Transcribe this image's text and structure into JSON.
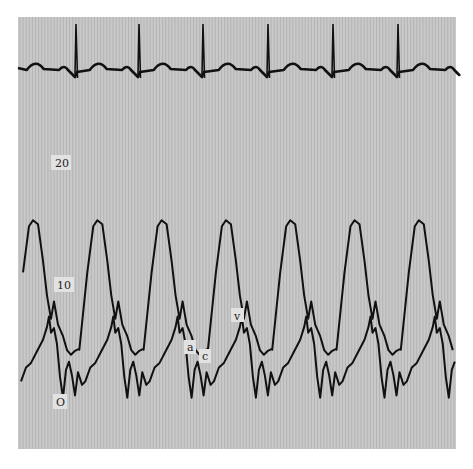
{
  "chart_data": {
    "type": "line",
    "title": "",
    "xlabel": "",
    "ylabel": "",
    "ylim": [
      0,
      25
    ],
    "y_ticks": [
      {
        "value": 20,
        "label": "20"
      },
      {
        "value": 10,
        "label": "10"
      },
      {
        "value": 0,
        "label": "O"
      }
    ],
    "grid": "vertical fine lines",
    "colors": {
      "paper": "#c9c9c9",
      "grid": "#a9a9a9",
      "trace": "#111111",
      "label_bg": "#e2e2e2"
    },
    "beats": 7,
    "series": [
      {
        "name": "ECG",
        "r_wave_count": 6
      },
      {
        "name": "Pressure trace (upper)",
        "peak_value": 15.5,
        "trough_value": 4.5,
        "beats": 7
      },
      {
        "name": "Pressure trace (lower, atrial)",
        "peak_value": 6,
        "trough_value": 0,
        "beats": 7
      }
    ],
    "annotations": [
      {
        "label": "a",
        "meaning": "a wave"
      },
      {
        "label": "c",
        "meaning": "c wave"
      },
      {
        "label": "v",
        "meaning": "v wave"
      }
    ]
  }
}
